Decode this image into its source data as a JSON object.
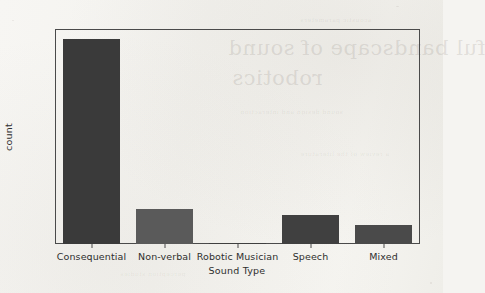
{
  "chart_data": {
    "type": "bar",
    "title": "",
    "xlabel": "Sound Type",
    "ylabel": "count",
    "categories": [
      "Consequential",
      "Non-verbal",
      "Robotic Musician",
      "Speech",
      "Mixed"
    ],
    "values": [
      160,
      27,
      1,
      23,
      15
    ],
    "ylim": [
      0,
      168
    ],
    "yticks": [
      0,
      20,
      40,
      60,
      80,
      100,
      120,
      140,
      160
    ],
    "ytick_labels": [
      "0",
      "20",
      "40",
      "60",
      "80",
      "100",
      "120",
      "140",
      "160"
    ],
    "grid": false,
    "legend": null,
    "bar_colors": [
      "#3a3a3a",
      "#5a5a5a",
      "#3f3f3f",
      "#404040",
      "#4a4a4a"
    ],
    "axis_color": "#4a4a4a",
    "background_color": "#f5f4f1"
  },
  "artifacts": {
    "bleed_line_1": "ful bandscape of sound",
    "bleed_line_2": "robotics",
    "bleed_line_3": "acoustic parameters",
    "bleed_line_4": "sound design and interaction",
    "bleed_line_5": "a review of the literature",
    "bleed_line_6": "perception studies"
  }
}
